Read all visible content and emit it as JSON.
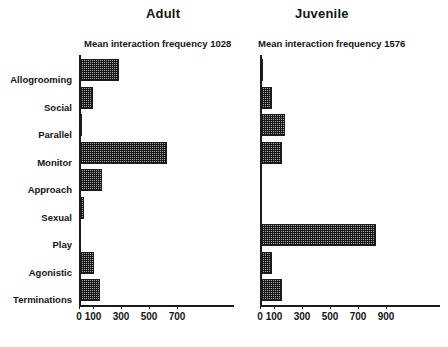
{
  "chart_data": {
    "type": "bar",
    "orientation": "horizontal",
    "title": "",
    "panels": [
      {
        "title": "Adult",
        "subtitle": "Mean interaction frequency 1028",
        "mean_interaction_frequency": 1028,
        "xlabel": "",
        "ylabel": "",
        "xlim": [
          0,
          800
        ],
        "xticks": [
          0,
          100,
          300,
          500,
          700
        ],
        "xtick_labels": [
          "0",
          "100",
          "300",
          "500",
          "700"
        ],
        "grid": false,
        "categories": [
          "Allogrooming",
          "Social",
          "Parallel",
          "Monitor",
          "Approach",
          "Sexual",
          "Play",
          "Agonistic",
          "Terminations"
        ],
        "values": [
          280,
          90,
          10,
          620,
          160,
          30,
          0,
          100,
          145
        ]
      },
      {
        "title": "Juvenile",
        "subtitle": "Mean interaction frequency  1576",
        "mean_interaction_frequency": 1576,
        "xlabel": "",
        "ylabel": "",
        "xlim": [
          0,
          1000
        ],
        "xticks": [
          0,
          100,
          300,
          500,
          700,
          900
        ],
        "xtick_labels": [
          "0",
          "100",
          "300",
          "500",
          "700",
          "900"
        ],
        "grid": false,
        "categories": [
          "Allogrooming",
          "Social",
          "Parallel",
          "Monitor",
          "Approach",
          "Sexual",
          "Play",
          "Agonistic",
          "Terminations"
        ],
        "values": [
          10,
          80,
          170,
          150,
          0,
          0,
          820,
          80,
          150
        ]
      }
    ],
    "legend": [],
    "style": {
      "bar_fill": "#a8a8a8",
      "bar_pattern": "checkerboard-hatch",
      "bar_edge": "#1c1c1c",
      "axis_color": "#1a1a1a",
      "background": "#ffffff"
    }
  }
}
